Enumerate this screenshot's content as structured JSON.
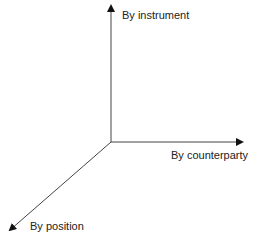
{
  "diagram": {
    "type": "3d-axes",
    "axes": {
      "vertical": {
        "label": "By instrument"
      },
      "horizontal": {
        "label": "By counterparty"
      },
      "diagonal": {
        "label": "By position"
      }
    },
    "colors": {
      "line": "#333333",
      "text": "#222222"
    }
  }
}
